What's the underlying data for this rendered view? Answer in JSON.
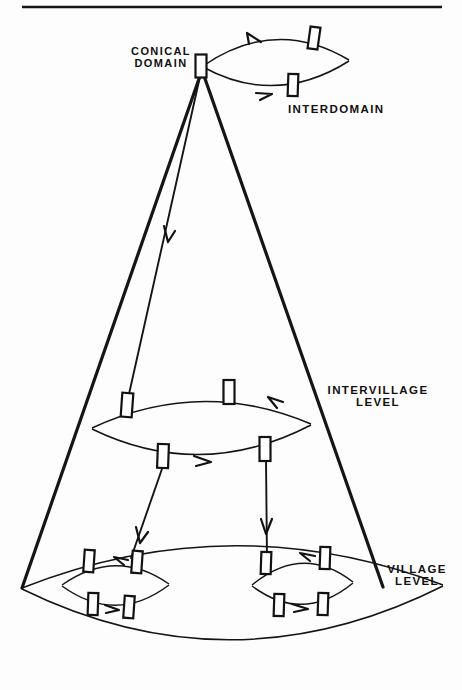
{
  "figure": {
    "title_present": false,
    "background": "#fdfdfd",
    "ink_color": "#151515",
    "width": 462,
    "height": 690
  },
  "labels": {
    "conical_domain": "CONICAL\nDOMAIN",
    "interdomain": "INTERDOMAIN",
    "intervillage_level": "INTERVILLAGE\nLEVEL",
    "village_level": "VILLAGE\nLEVEL"
  },
  "structure": {
    "levels": [
      {
        "name": "interdomain",
        "label": "INTERDOMAIN",
        "node_count": 2,
        "lens": true
      },
      {
        "name": "intervillage",
        "label": "INTERVILLAGE LEVEL",
        "node_count": 4,
        "lens": true
      },
      {
        "name": "village-left",
        "label": "VILLAGE LEVEL",
        "node_count": 4,
        "lens": true
      },
      {
        "name": "village-right",
        "label": "VILLAGE LEVEL",
        "node_count": 4,
        "lens": true
      }
    ],
    "apex": {
      "name": "conical-domain-apex",
      "label": "CONICAL DOMAIN",
      "node_count": 1
    },
    "cone_edges": 2,
    "descent_links": 3,
    "total_nodes": 15
  },
  "geometry": {
    "rule": {
      "x1": 22,
      "y1": 7,
      "x2": 442,
      "y2": 7
    },
    "apex": {
      "x": 201,
      "y": 66
    },
    "cone_left_base": {
      "x": 22,
      "y": 588
    },
    "cone_right_base": {
      "x": 383,
      "y": 587
    },
    "interdomain_lens": {
      "lx": 203,
      "ly": 66,
      "rx": 349,
      "ry": 60,
      "bow": 34
    },
    "intervillage_lens": {
      "lx": 92,
      "ly": 428,
      "rx": 311,
      "ry": 424,
      "bow": 36
    },
    "big_lens": {
      "lx": 22,
      "ly": 588,
      "rx": 443,
      "ry": 585,
      "bow": 72
    },
    "village_left_lens": {
      "lx": 62,
      "ly": 585,
      "rx": 169,
      "ry": 584,
      "bow": 27
    },
    "village_right_lens": {
      "lx": 252,
      "ly": 585,
      "rx": 353,
      "ry": 582,
      "bow": 27
    },
    "nodes": [
      {
        "id": "apex",
        "x": 201,
        "y": 66,
        "w": 11,
        "h": 23,
        "rot": 0
      },
      {
        "id": "interdomain-top",
        "x": 314,
        "y": 38,
        "w": 10,
        "h": 22,
        "rot": 8
      },
      {
        "id": "interdomain-bottom",
        "x": 293,
        "y": 85,
        "w": 10,
        "h": 22,
        "rot": 2
      },
      {
        "id": "intervillage-top-left",
        "x": 127,
        "y": 405,
        "w": 11,
        "h": 24,
        "rot": 4
      },
      {
        "id": "intervillage-top-right",
        "x": 229,
        "y": 392,
        "w": 11,
        "h": 24,
        "rot": 0
      },
      {
        "id": "intervillage-bottom-left",
        "x": 163,
        "y": 456,
        "w": 11,
        "h": 24,
        "rot": 2
      },
      {
        "id": "intervillage-bottom-right",
        "x": 265,
        "y": 449,
        "w": 11,
        "h": 24,
        "rot": 0
      },
      {
        "id": "village-left-top-left",
        "x": 89,
        "y": 561,
        "w": 10,
        "h": 22,
        "rot": 4
      },
      {
        "id": "village-left-top-right",
        "x": 137,
        "y": 562,
        "w": 10,
        "h": 22,
        "rot": 4
      },
      {
        "id": "village-left-bottom-left",
        "x": 93,
        "y": 604,
        "w": 10,
        "h": 22,
        "rot": 2
      },
      {
        "id": "village-left-bottom-right",
        "x": 129,
        "y": 607,
        "w": 10,
        "h": 22,
        "rot": 4
      },
      {
        "id": "village-right-top-left",
        "x": 266,
        "y": 563,
        "w": 10,
        "h": 22,
        "rot": 2
      },
      {
        "id": "village-right-top-right",
        "x": 325,
        "y": 558,
        "w": 10,
        "h": 22,
        "rot": 2
      },
      {
        "id": "village-right-bottom-left",
        "x": 279,
        "y": 605,
        "w": 10,
        "h": 22,
        "rot": 2
      },
      {
        "id": "village-right-bottom-right",
        "x": 323,
        "y": 604,
        "w": 10,
        "h": 22,
        "rot": 2
      }
    ],
    "links": [
      {
        "id": "apex-to-intervillage-top-left",
        "x1": 201,
        "y1": 72,
        "x2": 127,
        "y2": 403,
        "arrow_t": 0.42
      },
      {
        "id": "intervillage-bl-to-village-left",
        "x1": 163,
        "y1": 466,
        "x2": 131,
        "y2": 558,
        "arrow_t": 0.62
      },
      {
        "id": "intervillage-br-to-village-right",
        "x1": 266,
        "y1": 460,
        "x2": 267,
        "y2": 559,
        "arrow_t": 0.6
      }
    ]
  },
  "label_positions": {
    "conical_domain": {
      "x": 133,
      "y": 47,
      "size": 11
    },
    "interdomain": {
      "x": 289,
      "y": 104,
      "size": 11.5
    },
    "intervillage_level": {
      "x": 330,
      "y": 386,
      "size": 11.5
    },
    "village_level": {
      "x": 381,
      "y": 564,
      "size": 11.5
    }
  }
}
